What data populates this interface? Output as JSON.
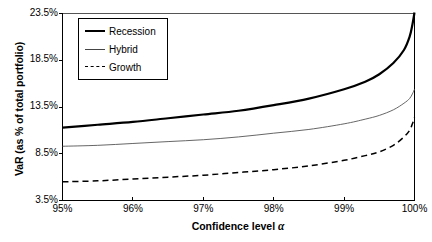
{
  "chart_data": {
    "type": "line",
    "title": "",
    "xlabel": "Confidence level α",
    "ylabel": "VaR (as % of total portfolio)",
    "xlim": [
      95,
      100
    ],
    "ylim": [
      3.5,
      23.5
    ],
    "grid": false,
    "legend_position": "top-left",
    "xticks": [
      "95%",
      "96%",
      "97%",
      "98%",
      "99%",
      "100%"
    ],
    "xtick_values": [
      95,
      96,
      97,
      98,
      99,
      100
    ],
    "yticks": [
      "3.5%",
      "8.5%",
      "13.5%",
      "18.5%",
      "23.5%"
    ],
    "ytick_values": [
      3.5,
      8.5,
      13.5,
      18.5,
      23.5
    ],
    "x": [
      95.0,
      95.5,
      96.0,
      96.5,
      97.0,
      97.5,
      98.0,
      98.5,
      99.0,
      99.3,
      99.5,
      99.7,
      99.85,
      99.93,
      99.97,
      100.0
    ],
    "series": [
      {
        "name": "Recession",
        "style": "thick-solid",
        "color": "#000000",
        "values": [
          11.3,
          11.6,
          11.9,
          12.3,
          12.7,
          13.1,
          13.7,
          14.4,
          15.4,
          16.2,
          17.0,
          18.2,
          19.6,
          21.0,
          22.3,
          23.6
        ]
      },
      {
        "name": "Hybrid",
        "style": "thin-solid",
        "color": "#555555",
        "values": [
          9.3,
          9.4,
          9.6,
          9.8,
          10.0,
          10.3,
          10.7,
          11.1,
          11.7,
          12.2,
          12.6,
          13.2,
          13.9,
          14.4,
          14.9,
          15.4
        ]
      },
      {
        "name": "Growth",
        "style": "dashed",
        "color": "#000000",
        "values": [
          5.5,
          5.6,
          5.8,
          6.0,
          6.2,
          6.5,
          6.8,
          7.2,
          7.8,
          8.3,
          8.7,
          9.4,
          10.3,
          11.0,
          11.7,
          12.4
        ]
      }
    ]
  },
  "legend": {
    "items": [
      {
        "label": "Recession"
      },
      {
        "label": "Hybrid"
      },
      {
        "label": "Growth"
      }
    ]
  }
}
